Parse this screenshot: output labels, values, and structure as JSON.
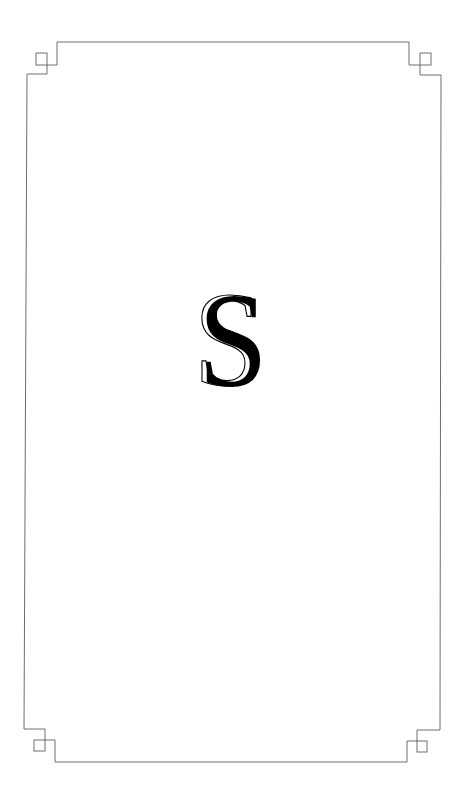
{
  "card": {
    "initial_letter": "S",
    "border_color": "#6e6e6e",
    "letter_color": "#000000",
    "background_color": "#ffffff",
    "corner_ornament": "greek-key-square"
  }
}
